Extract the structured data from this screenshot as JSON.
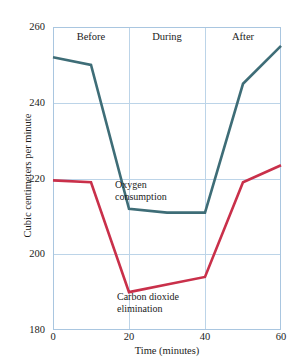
{
  "figure": {
    "top_caption": "",
    "phase_bands": [
      {
        "label": "Before",
        "x_center": 10
      },
      {
        "label": "During",
        "x_center": 30
      },
      {
        "label": "After",
        "x_center": 50
      }
    ],
    "annotations": [
      {
        "name": "oxygen-consumption-label",
        "line1": "Oxygen",
        "line2": "consumption"
      },
      {
        "name": "carbon-dioxide-elimination-label",
        "line1": "Carbon dioxide",
        "line2": "elimination"
      }
    ],
    "colors": {
      "oxygen": "#3E6D77",
      "carbon_dioxide": "#C9304A",
      "grid": "#bcd4e8",
      "frame": "#a9c6e0",
      "text": "#1b1b1b"
    }
  },
  "chart_data": {
    "type": "line",
    "title": "",
    "xlabel": "Time (minutes)",
    "ylabel": "Cubic centimeters per minute",
    "xlim": [
      0,
      60
    ],
    "ylim": [
      180,
      260
    ],
    "xticks": [
      0,
      20,
      40,
      60
    ],
    "yticks": [
      180,
      200,
      220,
      240,
      260
    ],
    "grid": true,
    "legend": "inline-annotations",
    "x": [
      0,
      10,
      20,
      30,
      40,
      50,
      60
    ],
    "series": [
      {
        "name": "Oxygen consumption",
        "color": "#3E6D77",
        "values": [
          252,
          250,
          212,
          211,
          211,
          245,
          255
        ]
      },
      {
        "name": "Carbon dioxide elimination",
        "color": "#C9304A",
        "values": [
          219.5,
          219,
          190,
          192,
          194,
          219,
          223.5
        ]
      }
    ],
    "vertical_dividers": [
      20,
      40
    ],
    "band_labels": [
      "Before",
      "During",
      "After"
    ]
  }
}
